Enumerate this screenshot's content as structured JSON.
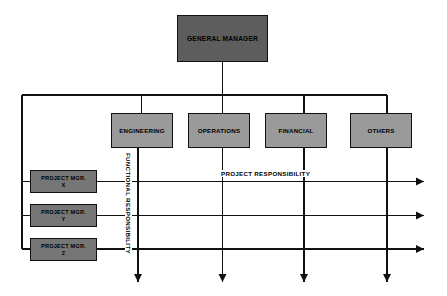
{
  "diagram": {
    "colors": {
      "background": "#ffffff",
      "line": "#111111",
      "general_manager_fill": "#5d5d5d",
      "functional_fill": "#9a9a9a",
      "project_manager_fill": "#767676",
      "text": "#000000"
    },
    "top": {
      "label": "GENERAL MANAGER"
    },
    "functional_units": [
      {
        "label": "ENGINEERING"
      },
      {
        "label": "OPERATIONS"
      },
      {
        "label": "FINANCIAL"
      },
      {
        "label": "OTHERS"
      }
    ],
    "project_managers": [
      {
        "line1": "PROJECT MGR.",
        "line2": "X"
      },
      {
        "line1": "PROJECT MGR.",
        "line2": "Y"
      },
      {
        "line1": "PROJECT MGR.",
        "line2": "Z"
      }
    ],
    "axis_labels": {
      "functional": "FUNCTIONAL RESPONSIBILITY",
      "project": "PROJECT RESPONSIBILITY"
    }
  }
}
